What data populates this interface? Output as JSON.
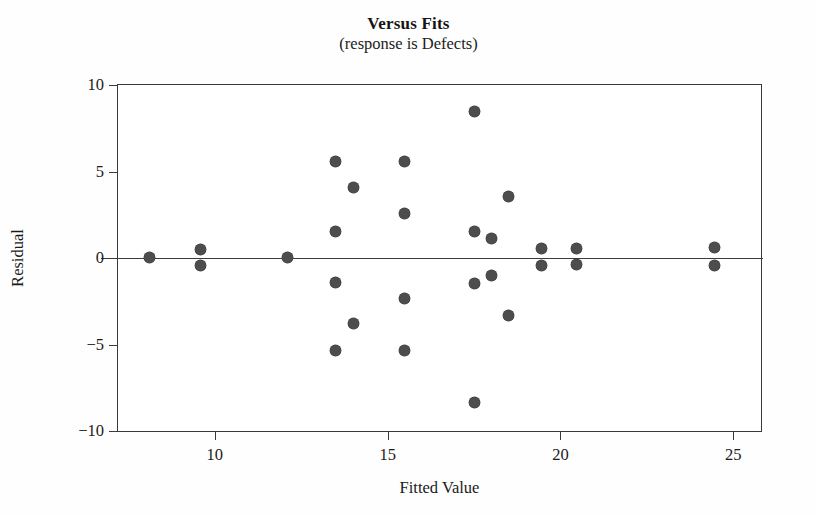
{
  "chart_data": {
    "type": "scatter",
    "title": "Versus Fits",
    "subtitle": "(response is Defects)",
    "xlabel": "Fitted Value",
    "ylabel": "Residual",
    "xlim": [
      7.2,
      25.8
    ],
    "ylim": [
      -10,
      10
    ],
    "xticks": [
      10,
      15,
      20,
      25
    ],
    "yticks": [
      10,
      5,
      0,
      -5,
      -10
    ],
    "xtick_labels": [
      "10",
      "15",
      "20",
      "25"
    ],
    "ytick_labels": [
      "10",
      "5",
      "0",
      "-5",
      "-10"
    ],
    "grid": false,
    "legend": false,
    "reference_line": {
      "y": 0,
      "color": "#3c3c3c"
    },
    "marker": {
      "shape": "circle",
      "color": "#4d4d4d",
      "size_px": 11
    },
    "points": [
      {
        "x": 8.1,
        "y": 0.05
      },
      {
        "x": 9.6,
        "y": 0.5
      },
      {
        "x": 9.6,
        "y": -0.45
      },
      {
        "x": 12.1,
        "y": 0.05
      },
      {
        "x": 13.5,
        "y": 5.55
      },
      {
        "x": 13.5,
        "y": 1.55
      },
      {
        "x": 13.5,
        "y": -1.4
      },
      {
        "x": 13.5,
        "y": -5.35
      },
      {
        "x": 14.0,
        "y": 4.05
      },
      {
        "x": 14.0,
        "y": -3.8
      },
      {
        "x": 15.5,
        "y": 5.6
      },
      {
        "x": 15.5,
        "y": 2.6
      },
      {
        "x": 15.5,
        "y": -2.35
      },
      {
        "x": 15.5,
        "y": -5.35
      },
      {
        "x": 17.5,
        "y": 8.45
      },
      {
        "x": 17.5,
        "y": 1.55
      },
      {
        "x": 17.5,
        "y": -1.45
      },
      {
        "x": 17.5,
        "y": -8.35
      },
      {
        "x": 18.0,
        "y": 1.1
      },
      {
        "x": 18.0,
        "y": -1.0
      },
      {
        "x": 18.5,
        "y": 3.55
      },
      {
        "x": 18.5,
        "y": -3.3
      },
      {
        "x": 19.45,
        "y": 0.55
      },
      {
        "x": 19.45,
        "y": -0.45
      },
      {
        "x": 20.45,
        "y": 0.55
      },
      {
        "x": 20.45,
        "y": -0.4
      },
      {
        "x": 24.45,
        "y": 0.6
      },
      {
        "x": 24.45,
        "y": -0.45
      }
    ]
  }
}
